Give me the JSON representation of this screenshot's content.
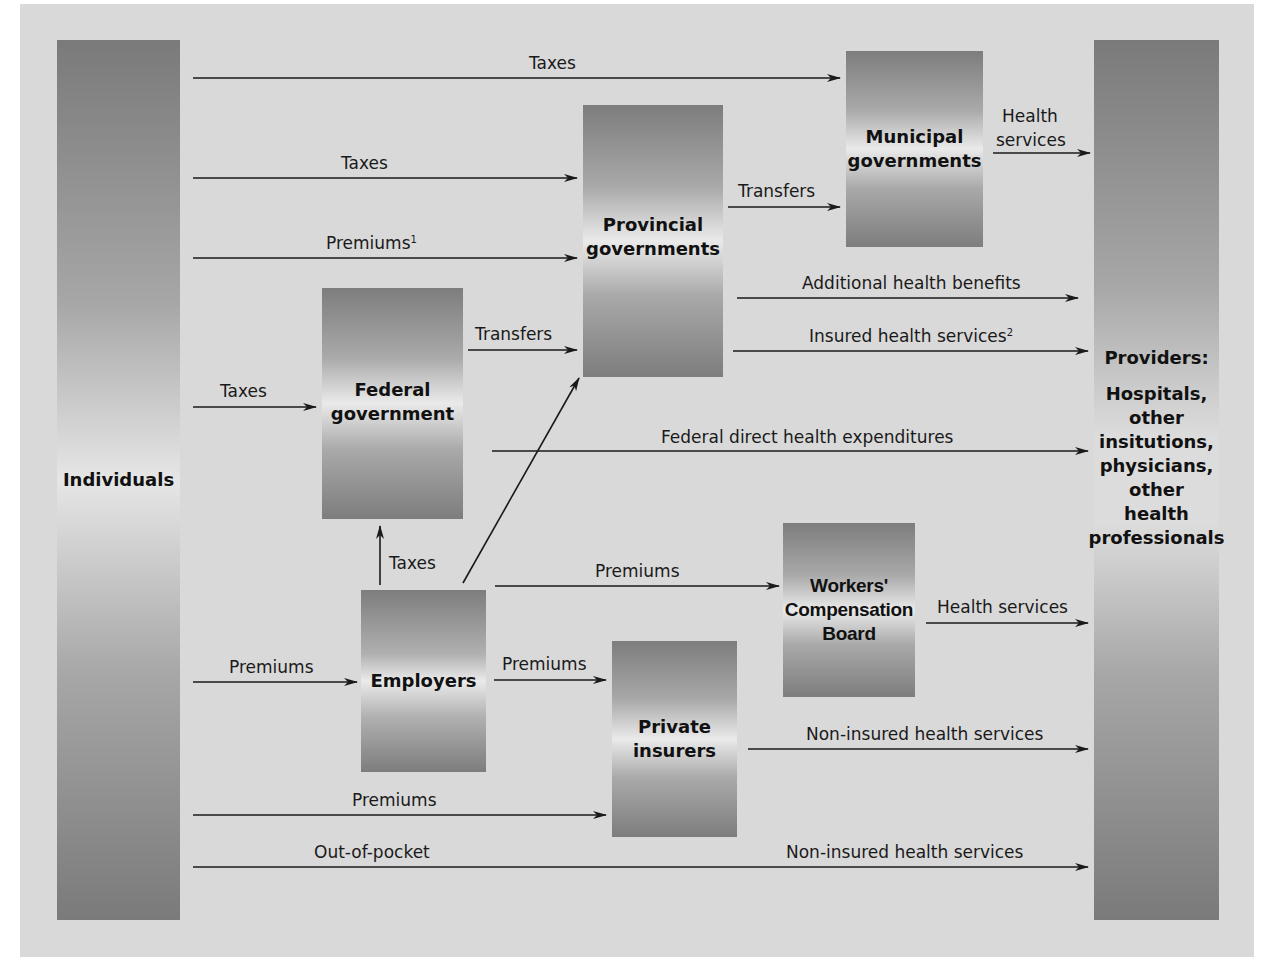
{
  "diagram": {
    "type": "flow",
    "nodes": {
      "individuals": "Individuals",
      "federal": {
        "line1": "Federal",
        "line2": "government"
      },
      "provincial": {
        "line1": "Provincial",
        "line2": "governments"
      },
      "municipal": {
        "line1": "Municipal",
        "line2": "governments"
      },
      "employers": "Employers",
      "wcb": {
        "line1": "Workers'",
        "line2": "Compensation",
        "line3": "Board"
      },
      "private": {
        "line1": "Private",
        "line2": "insurers"
      },
      "providers": {
        "title": "Providers:",
        "lines": [
          "Hospitals,",
          "other",
          "insitutions,",
          "physicians,",
          "other",
          "health",
          "professionals"
        ]
      }
    },
    "edges": [
      {
        "from": "Individuals",
        "to": "Municipal governments",
        "label": "Taxes"
      },
      {
        "from": "Individuals",
        "to": "Provincial governments",
        "label": "Taxes"
      },
      {
        "from": "Individuals",
        "to": "Provincial governments",
        "label": "Premiums",
        "footnote": "1"
      },
      {
        "from": "Individuals",
        "to": "Federal government",
        "label": "Taxes"
      },
      {
        "from": "Federal government",
        "to": "Provincial governments",
        "label": "Transfers"
      },
      {
        "from": "Provincial governments",
        "to": "Municipal governments",
        "label": "Transfers"
      },
      {
        "from": "Municipal governments",
        "to": "Providers",
        "label": "Health services"
      },
      {
        "from": "Provincial governments",
        "to": "Providers",
        "label": "Additional health benefits"
      },
      {
        "from": "Provincial governments",
        "to": "Providers",
        "label": "Insured health services",
        "footnote": "2"
      },
      {
        "from": "Federal government",
        "to": "Providers",
        "label": "Federal direct health expenditures"
      },
      {
        "from": "Employers",
        "to": "Federal government",
        "label": "Taxes"
      },
      {
        "from": "Employers",
        "to": "Provincial governments",
        "label": ""
      },
      {
        "from": "Employers",
        "to": "Workers' Compensation Board",
        "label": "Premiums"
      },
      {
        "from": "Workers' Compensation Board",
        "to": "Providers",
        "label": "Health services"
      },
      {
        "from": "Individuals",
        "to": "Employers",
        "label": "Premiums"
      },
      {
        "from": "Employers",
        "to": "Private insurers",
        "label": "Premiums"
      },
      {
        "from": "Private insurers",
        "to": "Providers",
        "label": "Non-insured health services"
      },
      {
        "from": "Individuals",
        "to": "Private insurers",
        "label": "Premiums"
      },
      {
        "from": "Individuals",
        "to": "Providers",
        "label": "Out-of-pocket / Non-insured health services"
      }
    ]
  },
  "labels": {
    "taxes_municipal": "Taxes",
    "taxes_provincial": "Taxes",
    "premiums_provincial": "Premiums",
    "premiums_provincial_fn": "1",
    "taxes_federal": "Taxes",
    "transfers_fed_prov": "Transfers",
    "transfers_prov_muni": "Transfers",
    "health_services_muni_1": "Health",
    "health_services_muni_2": "services",
    "additional_benefits": "Additional health benefits",
    "insured_services": "Insured health services",
    "insured_services_fn": "2",
    "federal_direct": "Federal direct health expenditures",
    "taxes_employers": "Taxes",
    "premiums_wcb": "Premiums",
    "health_services_wcb": "Health services",
    "premiums_employers": "Premiums",
    "premiums_emp_private": "Premiums",
    "noninsured_private": "Non-insured health services",
    "premiums_private": "Premiums",
    "out_of_pocket": "Out-of-pocket",
    "noninsured_oop": "Non-insured health services"
  },
  "colors": {
    "background": "#d9d9d9",
    "node_dark": "#7d7d7d",
    "node_light": "#eaeaea",
    "line": "#1a1a1a"
  }
}
